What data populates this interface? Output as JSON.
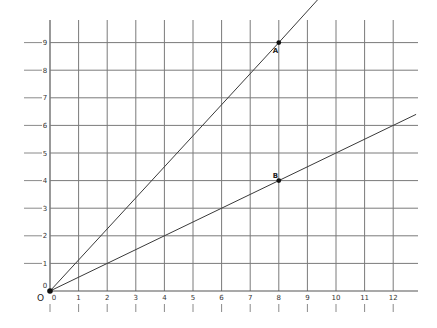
{
  "chart_data": {
    "type": "line",
    "title": "",
    "xlabel": "",
    "ylabel": "",
    "xlim": [
      0,
      12.8
    ],
    "ylim": [
      0,
      9.7
    ],
    "grid": true,
    "origin_label": "O",
    "x_ticks": [
      "0",
      "1",
      "2",
      "3",
      "4",
      "5",
      "6",
      "7",
      "8",
      "9",
      "10",
      "11",
      "12"
    ],
    "y_ticks": [
      "0",
      "1",
      "2",
      "3",
      "4",
      "5",
      "6",
      "7",
      "8",
      "9"
    ],
    "series": [
      {
        "name": "OA",
        "x": [
          0,
          8,
          9.4
        ],
        "y": [
          0,
          9,
          10.6
        ]
      },
      {
        "name": "OB",
        "x": [
          0,
          8,
          12.8
        ],
        "y": [
          0,
          4,
          6.4
        ]
      }
    ],
    "points": [
      {
        "label": "A",
        "x": 8,
        "y": 9
      },
      {
        "label": "B",
        "x": 8,
        "y": 4
      },
      {
        "label": "",
        "x": 0,
        "y": 0
      }
    ]
  },
  "layout": {
    "origin_px": [
      50,
      291
    ],
    "x_step_px": 28.6,
    "y_step_px": 27.6,
    "x_end_px": 418,
    "y_top_px": 20,
    "line_color": "#3a3a3a",
    "grid_color": "#7a7a7a"
  }
}
